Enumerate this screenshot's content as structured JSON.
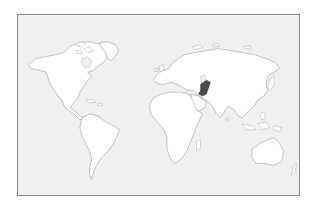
{
  "map": {
    "type": "world-locator-map",
    "projection": "equirectangular",
    "ocean_color": "#f0f0f0",
    "land_color": "#ffffff",
    "border_color": "#9a9a9a",
    "frame_color": "#8a8a8a",
    "highlighted_region": {
      "name": "Pakistan",
      "color": "#4a4a4a"
    },
    "continents": [
      "North America",
      "South America",
      "Europe",
      "Africa",
      "Asia",
      "Australia"
    ]
  }
}
